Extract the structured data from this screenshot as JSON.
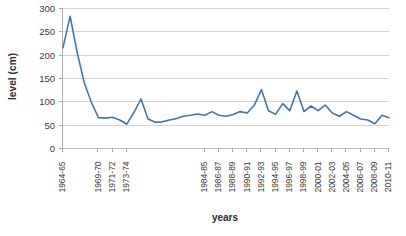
{
  "chart_data": {
    "type": "line",
    "title": "",
    "xlabel": "years",
    "ylabel": "level (cm)",
    "ylim": [
      0,
      300
    ],
    "yticks": [
      0,
      50,
      100,
      150,
      200,
      250,
      300
    ],
    "grid": true,
    "legend": "none",
    "series_color": "#4575A8",
    "gridline_color": "#d4d4d4",
    "axis_color": "#b0b0b0",
    "categories": [
      "1964-65",
      "1965-66",
      "1966-67",
      "1967-68",
      "1968-69",
      "1969-70",
      "1970-71",
      "1971-72",
      "1972-73",
      "1973-74",
      "1974-75",
      "1975-76",
      "1976-77",
      "1977-78",
      "1978-79",
      "1979-80",
      "1980-81",
      "1981-82",
      "1982-83",
      "1983-84",
      "1984-85",
      "1985-86",
      "1986-87",
      "1987-88",
      "1988-89",
      "1989-90",
      "1990-91",
      "1991-92",
      "1992-93",
      "1993-94",
      "1994-95",
      "1995-96",
      "1996-97",
      "1997-98",
      "1998-99",
      "1999-00",
      "2000-01",
      "2001-02",
      "2002-03",
      "2003-04",
      "2004-05",
      "2005-06",
      "2006-07",
      "2007-08",
      "2008-09",
      "2009-10",
      "2010-11"
    ],
    "tick_labels": [
      "1964-65",
      "1969-70",
      "1971-72",
      "1973-74",
      "1984-85",
      "1986-87",
      "1988-89",
      "1990-91",
      "1992-93",
      "1994-95",
      "1996-97",
      "1998-99",
      "2000-01",
      "2002-03",
      "2004-05",
      "2006-07",
      "2008-09",
      "2010-11"
    ],
    "tick_label_indices": [
      0,
      5,
      7,
      9,
      20,
      22,
      24,
      26,
      28,
      30,
      32,
      34,
      36,
      38,
      40,
      42,
      44,
      46
    ],
    "series": [
      {
        "name": "level",
        "values": [
          215,
          282,
          205,
          140,
          98,
          65,
          64,
          66,
          60,
          51,
          76,
          105,
          62,
          55,
          56,
          60,
          63,
          68,
          70,
          73,
          70,
          78,
          70,
          68,
          72,
          78,
          75,
          92,
          125,
          80,
          72,
          95,
          80,
          122,
          78,
          90,
          80,
          92,
          75,
          68,
          78,
          70,
          62,
          60,
          52,
          70,
          65
        ]
      }
    ]
  },
  "axes": {
    "y_title": "level (cm)",
    "x_title": "years"
  }
}
